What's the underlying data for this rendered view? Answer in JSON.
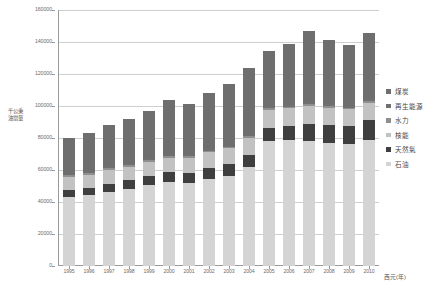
{
  "chart_data": {
    "type": "bar",
    "stacked": true,
    "title": "",
    "xlabel": "西元(年)",
    "ylabel": "千公秉油當量",
    "ylim": [
      0,
      160000
    ],
    "ytick_step": 20000,
    "ytick_labels": [
      "0",
      "20000",
      "40000",
      "60000",
      "80000",
      "100000",
      "120000",
      "140000",
      "160000"
    ],
    "grid": true,
    "legend_position": "right",
    "categories": [
      "1995",
      "1996",
      "1997",
      "1998",
      "1999",
      "2000",
      "2001",
      "2002",
      "2003",
      "2004",
      "2005",
      "2006",
      "2007",
      "2008",
      "2009",
      "2010"
    ],
    "series": [
      {
        "name": "石油",
        "color": "#d4d4d4",
        "values": [
          43000,
          44500,
          46500,
          48000,
          50500,
          52500,
          52000,
          54500,
          56500,
          62000,
          78000,
          78500,
          78000,
          77000,
          76000,
          78500
        ]
      },
      {
        "name": "天然氣",
        "color": "#3f3f3f",
        "values": [
          4500,
          4500,
          5000,
          5500,
          5500,
          6000,
          6000,
          6500,
          7000,
          7500,
          8500,
          9000,
          10500,
          11000,
          11500,
          12500
        ]
      },
      {
        "name": "核能",
        "color": "#c2c2c2",
        "values": [
          8000,
          8000,
          8500,
          8500,
          9000,
          9000,
          9500,
          10000,
          10000,
          10500,
          11000,
          11000,
          11500,
          11000,
          10500,
          11000
        ]
      },
      {
        "name": "水力",
        "color": "#8f8f8f",
        "values": [
          1200,
          1200,
          1300,
          1300,
          1300,
          1400,
          1200,
          1100,
          1000,
          1200,
          1200,
          1100,
          1000,
          1000,
          1000,
          1000
        ]
      },
      {
        "name": "再生能源",
        "color": "#707070",
        "values": [
          500,
          500,
          600,
          600,
          700,
          700,
          700,
          800,
          800,
          900,
          1000,
          1100,
          1200,
          1200,
          1300,
          1400
        ]
      },
      {
        "name": "煤炭",
        "color": "#6e6e6e",
        "values": [
          23000,
          24500,
          26000,
          28000,
          30000,
          34000,
          32000,
          35500,
          38500,
          41500,
          35000,
          38000,
          45000,
          40000,
          38000,
          41500
        ]
      }
    ],
    "totals": [
      80200,
      83200,
      87900,
      91900,
      97000,
      103600,
      101400,
      108400,
      113800,
      123600,
      134700,
      138700,
      147200,
      141200,
      138300,
      145900
    ]
  },
  "legend": {
    "items": [
      {
        "label": "煤炭",
        "color": "#6e6e6e",
        "name": "coal"
      },
      {
        "label": "再生能源",
        "color": "#707070",
        "name": "renewable"
      },
      {
        "label": "水力",
        "color": "#8f8f8f",
        "name": "hydro"
      },
      {
        "label": "核能",
        "color": "#c2c2c2",
        "name": "nuclear"
      },
      {
        "label": "天然氣",
        "color": "#3f3f3f",
        "name": "natural-gas"
      },
      {
        "label": "石油",
        "color": "#d4d4d4",
        "name": "oil"
      }
    ]
  },
  "axes": {
    "y_title_line1": "千公秉",
    "y_title_line2": "油當量",
    "x_title": "西元(年)"
  }
}
